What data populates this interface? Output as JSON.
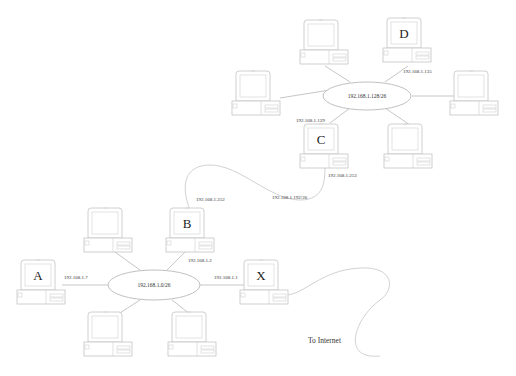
{
  "diagram": {
    "subnets": [
      {
        "id": "net1",
        "label": "192.168.1.0/26"
      },
      {
        "id": "net2",
        "label": "192.168.1.128/26"
      },
      {
        "id": "net3",
        "label": "192.168.1.192/26"
      }
    ],
    "hosts": [
      {
        "id": "A",
        "letter": "A",
        "ip": "192.168.1.7"
      },
      {
        "id": "B",
        "letter": "B",
        "ip_lan": "192.168.1.2",
        "ip_link": "192.168.1.252"
      },
      {
        "id": "X",
        "letter": "X",
        "ip": "192.168.1.1"
      },
      {
        "id": "C",
        "letter": "C",
        "ip_lan": "192.168.1.129",
        "ip_link": "192.168.1.253"
      },
      {
        "id": "D",
        "letter": "D",
        "ip": "192.168.1.135"
      }
    ],
    "unlabeled_hosts": 6,
    "internet_label": "To Internet"
  }
}
